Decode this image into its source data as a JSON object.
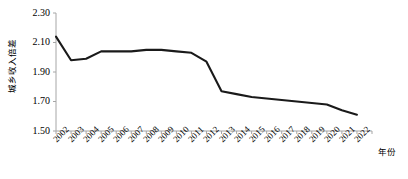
{
  "chart_data": {
    "type": "line",
    "title": "",
    "xlabel": "年份",
    "ylabel": "城乡收入倍差",
    "ylim": [
      1.5,
      2.3
    ],
    "ytick_labels": [
      "2.30",
      "2.10",
      "1.90",
      "1.70",
      "1.50"
    ],
    "ytick_values": [
      2.3,
      2.1,
      1.9,
      1.7,
      1.5
    ],
    "grid": false,
    "legend": "none",
    "line_color": "#1a1a1a",
    "axis_color": "#a6a6a6",
    "categories": [
      "2002",
      "2003",
      "2004",
      "2005",
      "2006",
      "2007",
      "2008",
      "2009",
      "2010",
      "2011",
      "2012",
      "2013",
      "2014",
      "2015",
      "2016",
      "2017",
      "2018",
      "2019",
      "2020",
      "2021",
      "2022"
    ],
    "series": [
      {
        "name": "城乡收入倍差",
        "values": [
          2.14,
          1.98,
          1.99,
          2.04,
          2.04,
          2.04,
          2.05,
          2.05,
          2.04,
          2.03,
          1.97,
          1.77,
          1.75,
          1.73,
          1.72,
          1.71,
          1.7,
          1.69,
          1.68,
          1.64,
          1.61
        ]
      }
    ]
  }
}
